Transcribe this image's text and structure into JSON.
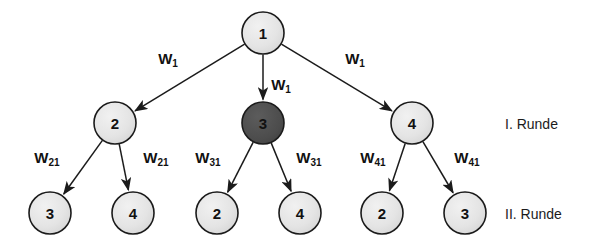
{
  "diagram": {
    "colors": {
      "node_light_fill": "#e2e2e2",
      "node_dark_fill": "#4f4f4f",
      "stroke": "#1b1b1b",
      "text": "#111111",
      "background": "#ffffff"
    },
    "nodes": [
      {
        "id": "root",
        "label": "1",
        "cx": 263,
        "cy": 33,
        "r": 21,
        "shade": "light"
      },
      {
        "id": "m1",
        "label": "2",
        "cx": 115,
        "cy": 123,
        "r": 21,
        "shade": "light"
      },
      {
        "id": "m2",
        "label": "3",
        "cx": 263,
        "cy": 123,
        "r": 21,
        "shade": "dark"
      },
      {
        "id": "m3",
        "label": "4",
        "cx": 412,
        "cy": 123,
        "r": 21,
        "shade": "light"
      },
      {
        "id": "b1",
        "label": "3",
        "cx": 50,
        "cy": 213,
        "r": 21,
        "shade": "light"
      },
      {
        "id": "b2",
        "label": "4",
        "cx": 133,
        "cy": 213,
        "r": 21,
        "shade": "light"
      },
      {
        "id": "b3",
        "label": "2",
        "cx": 217,
        "cy": 213,
        "r": 21,
        "shade": "light"
      },
      {
        "id": "b4",
        "label": "4",
        "cx": 300,
        "cy": 213,
        "r": 21,
        "shade": "light"
      },
      {
        "id": "b5",
        "label": "2",
        "cx": 382,
        "cy": 213,
        "r": 21,
        "shade": "light"
      },
      {
        "id": "b6",
        "label": "3",
        "cx": 465,
        "cy": 213,
        "r": 21,
        "shade": "light"
      }
    ],
    "edges": [
      {
        "id": "e-root-m1",
        "from": "root",
        "to": "m1"
      },
      {
        "id": "e-root-m2",
        "from": "root",
        "to": "m2"
      },
      {
        "id": "e-root-m3",
        "from": "root",
        "to": "m3"
      },
      {
        "id": "e-m1-b1",
        "from": "m1",
        "to": "b1"
      },
      {
        "id": "e-m1-b2",
        "from": "m1",
        "to": "b2"
      },
      {
        "id": "e-m2-b3",
        "from": "m2",
        "to": "b3"
      },
      {
        "id": "e-m2-b4",
        "from": "m2",
        "to": "b4"
      },
      {
        "id": "e-m3-b5",
        "from": "m3",
        "to": "b5"
      },
      {
        "id": "e-m3-b6",
        "from": "m3",
        "to": "b6"
      }
    ],
    "edge_labels": [
      {
        "id": "w-root-left",
        "base": "W",
        "sub": "1",
        "x": 168,
        "y": 58
      },
      {
        "id": "w-root-middle",
        "base": "W",
        "sub": "1",
        "x": 281,
        "y": 84
      },
      {
        "id": "w-root-right",
        "base": "W",
        "sub": "1",
        "x": 355,
        "y": 58
      },
      {
        "id": "w-m1-left",
        "base": "W",
        "sub": "21",
        "x": 47,
        "y": 157
      },
      {
        "id": "w-m1-right",
        "base": "W",
        "sub": "21",
        "x": 156,
        "y": 157
      },
      {
        "id": "w-m2-left",
        "base": "W",
        "sub": "31",
        "x": 208,
        "y": 157
      },
      {
        "id": "w-m2-right",
        "base": "W",
        "sub": "31",
        "x": 309,
        "y": 157
      },
      {
        "id": "w-m3-left",
        "base": "W",
        "sub": "41",
        "x": 373,
        "y": 157
      },
      {
        "id": "w-m3-right",
        "base": "W",
        "sub": "41",
        "x": 467,
        "y": 157
      }
    ],
    "round_labels": [
      {
        "id": "round-1",
        "text": "I. Runde",
        "x": 505,
        "y": 124
      },
      {
        "id": "round-2",
        "text": "II. Runde",
        "x": 505,
        "y": 214
      }
    ]
  }
}
